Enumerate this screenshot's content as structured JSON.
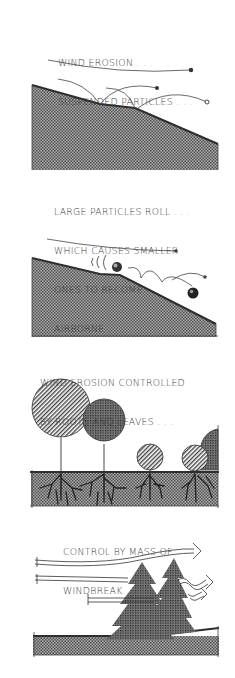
{
  "panels": [
    {
      "id": "suspended",
      "caption_lines": [
        "WIND EROSION . . .",
        "SUSPENDED PARTICLES . . ."
      ]
    },
    {
      "id": "rolling",
      "caption_lines": [
        "LARGE PARTICLES ROLL . . .",
        "WHICH CAUSES SMALLER",
        "ONES TO BECOME",
        "AIRBORNE . . ."
      ]
    },
    {
      "id": "roots",
      "caption_lines": [
        "WIND EROSION CONTROLLED",
        "BY ROOTS AND LEAVES . . ."
      ]
    },
    {
      "id": "windbreak",
      "caption_lines": [
        "CONTROL BY MASS OF",
        "WINDBREAK . . ."
      ]
    }
  ],
  "colors": {
    "ink": "#2e2e2e",
    "ground": "#8a8a8a",
    "background": "#ffffff"
  }
}
